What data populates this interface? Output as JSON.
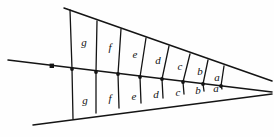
{
  "figure": {
    "type": "geometric-diagram",
    "background_color": "#fefefe",
    "stroke_color": "#141414",
    "label_color": "#111111"
  },
  "apex": {
    "x": 247,
    "y": 87
  },
  "rays": [
    {
      "name": "upper-ray",
      "start": {
        "x": 64,
        "y": 8
      },
      "end": {
        "x": 272,
        "y": 81
      }
    },
    {
      "name": "middle-ray",
      "start": {
        "x": 8,
        "y": 60
      },
      "end": {
        "x": 272,
        "y": 92
      }
    },
    {
      "name": "lower-ray",
      "start": {
        "x": 33,
        "y": 125
      },
      "end": {
        "x": 272,
        "y": 94
      }
    }
  ],
  "marker_dot": {
    "name": "point-marker",
    "x": 52,
    "y": 66
  },
  "divider_vertices_middle": [
    {
      "x": 72,
      "y": 69
    },
    {
      "x": 96,
      "y": 72
    },
    {
      "x": 118,
      "y": 74
    },
    {
      "x": 140,
      "y": 77
    },
    {
      "x": 162,
      "y": 79
    },
    {
      "x": 183,
      "y": 82
    },
    {
      "x": 203,
      "y": 84
    },
    {
      "x": 221,
      "y": 86
    }
  ],
  "divider_vertices_upper": [
    {
      "x": 70,
      "y": 10
    },
    {
      "x": 97,
      "y": 21
    },
    {
      "x": 121,
      "y": 29
    },
    {
      "x": 146,
      "y": 38
    },
    {
      "x": 169,
      "y": 46
    },
    {
      "x": 190,
      "y": 54
    },
    {
      "x": 208,
      "y": 60
    },
    {
      "x": 224,
      "y": 66
    }
  ],
  "divider_vertices_lower": [
    {
      "x": 73,
      "y": 119
    },
    {
      "x": 96,
      "y": 113
    },
    {
      "x": 119,
      "y": 108
    },
    {
      "x": 141,
      "y": 103
    },
    {
      "x": 163,
      "y": 98
    },
    {
      "x": 184,
      "y": 94
    },
    {
      "x": 204,
      "y": 91
    },
    {
      "x": 222,
      "y": 89
    }
  ],
  "rows": [
    {
      "name": "upper-row",
      "cells": [
        {
          "label": "g",
          "x": 84,
          "y": 43
        },
        {
          "label": "f",
          "x": 110,
          "y": 48
        },
        {
          "label": "e",
          "x": 135,
          "y": 55
        },
        {
          "label": "d",
          "x": 158,
          "y": 61
        },
        {
          "label": "c",
          "x": 180,
          "y": 67
        },
        {
          "label": "b",
          "x": 200,
          "y": 72
        },
        {
          "label": "a",
          "x": 217,
          "y": 78
        }
      ]
    },
    {
      "name": "lower-row",
      "cells": [
        {
          "label": "g",
          "x": 85,
          "y": 101
        },
        {
          "label": "f",
          "x": 110,
          "y": 99
        },
        {
          "label": "e",
          "x": 134,
          "y": 97
        },
        {
          "label": "d",
          "x": 156,
          "y": 95
        },
        {
          "label": "c",
          "x": 178,
          "y": 93
        },
        {
          "label": "b",
          "x": 198,
          "y": 91
        },
        {
          "label": "a",
          "x": 216,
          "y": 89
        }
      ]
    }
  ]
}
